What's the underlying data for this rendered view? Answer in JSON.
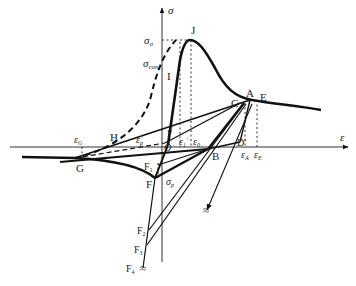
{
  "diagram": {
    "type": "stress-strain hysteresis diagram",
    "axes": {
      "y_label": "σ",
      "x_label": "ε"
    },
    "stress_labels": {
      "sigma_o": "σ",
      "sigma_o_sub": "o",
      "sigma_con": "σ",
      "sigma_con_sub": "con",
      "sigma_p": "σ",
      "sigma_p_sub": "p"
    },
    "strain_labels": {
      "eps_G": "ε",
      "eps_G_sub": "G",
      "eps_p": "ε",
      "eps_p_sub": "p",
      "eps_1": "ε",
      "eps_1_sub": "1",
      "eps_1_prime": "'",
      "eps_0": "ε",
      "eps_0_sub": "0",
      "eps_A": "ε",
      "eps_A_sub": "A",
      "eps_E": "ε",
      "eps_E_sub": "E"
    },
    "points": {
      "J": "J",
      "I": "I",
      "I_prime": "I'",
      "O": "O",
      "A": "A",
      "C": "C",
      "E": "E",
      "D_prime": "D'",
      "B": "B",
      "H": "H",
      "G": "G",
      "F": "F",
      "F1": "F",
      "F1_sub": "1",
      "F2": "F",
      "F2_sub": "2",
      "F3": "F",
      "F3_sub": "3",
      "F4": "F",
      "F4_sub": "4"
    },
    "break_symbol": "≈",
    "colors": {
      "ink": "#111111",
      "background": "#ffffff"
    }
  }
}
